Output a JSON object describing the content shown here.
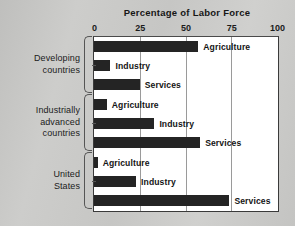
{
  "chart_data": {
    "type": "bar",
    "orientation": "horizontal",
    "title": "Percentage of Labor Force",
    "xlabel": "",
    "ylabel": "",
    "xlim": [
      0,
      100
    ],
    "xticks": [
      0,
      25,
      50,
      75,
      100
    ],
    "xtick_labels": [
      "0",
      "25",
      "50",
      "75",
      "100"
    ],
    "grid": true,
    "legend": "none",
    "bar_color": "#242424",
    "background_color": "#ffffff",
    "page_background_color": "#c8c8c6",
    "groups": [
      {
        "name": "Developing countries",
        "label_lines": [
          "Developing",
          "countries"
        ],
        "bars": [
          {
            "label": "Agriculture",
            "value": 57
          },
          {
            "label": "Industry",
            "value": 9
          },
          {
            "label": "Services",
            "value": 25
          }
        ]
      },
      {
        "name": "Industrially advanced countries",
        "label_lines": [
          "Industrially",
          "advanced",
          "countries"
        ],
        "bars": [
          {
            "label": "Agriculture",
            "value": 7
          },
          {
            "label": "Industry",
            "value": 33
          },
          {
            "label": "Services",
            "value": 58
          }
        ]
      },
      {
        "name": "United States",
        "label_lines": [
          "United",
          "States"
        ],
        "bars": [
          {
            "label": "Agriculture",
            "value": 2
          },
          {
            "label": "Industry",
            "value": 23
          },
          {
            "label": "Services",
            "value": 74
          }
        ]
      }
    ]
  }
}
